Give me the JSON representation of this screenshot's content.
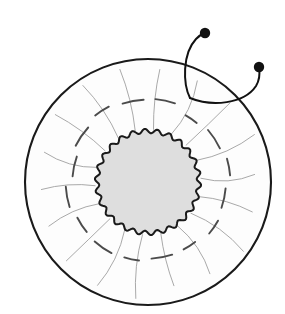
{
  "figure": {
    "canvas": {
      "width": 285,
      "height": 314,
      "background": "#ffffff"
    }
  },
  "geometry": {
    "center": {
      "x": 148,
      "y": 182
    },
    "outer_circle": {
      "name": "outer-boundary",
      "radius": 123,
      "stroke": "#1a1a1a",
      "stroke_width": 2.1,
      "fill": "#fdfdfd"
    },
    "inner_core": {
      "name": "scalloped-core",
      "mean_radius": 51,
      "scallop_count": 26,
      "scallop_amplitude": 2.2,
      "stroke": "#1a1a1a",
      "stroke_width": 2.0,
      "fill": "#dedede"
    },
    "spokes": {
      "name": "radial-striations",
      "count": 18,
      "inner_radius": 53,
      "outer_radius": 112,
      "stroke": "#9a9a9a",
      "stroke_width": 1.0,
      "curvature": 9,
      "start_angle_deg": -84
    },
    "arc_dashes": {
      "name": "tangential-dashes",
      "count": 16,
      "radius": 80,
      "span_deg": 13,
      "stroke": "#4b4b4b",
      "stroke_width": 1.9,
      "start_angle_deg": -78,
      "radius_jitter": 5
    }
  },
  "annotations": {
    "leader_stroke": "#111111",
    "leader_width": 2.0,
    "dot_fill": "#111111",
    "anchor": {
      "x": 190,
      "y": 98
    },
    "lines": [
      {
        "name": "leader-line-1",
        "dot": {
          "x": 205,
          "y": 33,
          "r": 5.2
        },
        "path": "M 190 98 C 183 84, 182 54, 196 39 C 199 36, 202 34, 204 33"
      },
      {
        "name": "leader-line-2",
        "dot": {
          "x": 259,
          "y": 67,
          "r": 5.2
        },
        "path": "M 190 98 C 212 107, 244 104, 256 86 C 259 81, 260 74, 259 68"
      }
    ]
  },
  "labels": {
    "outer_boundary": "outer boundary",
    "inner_core": "inner core",
    "radial_striations": "radial striations",
    "tangential_dashes": "tangential dashes",
    "leader_1": "annotation pointer 1",
    "leader_2": "annotation pointer 2"
  }
}
